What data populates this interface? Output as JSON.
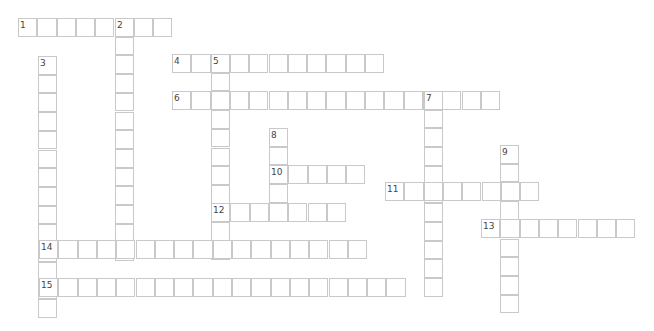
{
  "puzzle": {
    "type": "crossword",
    "cell_w": 19.3,
    "cell_h": 18.7,
    "words": [
      {
        "number": "1",
        "dir": "across",
        "x": 18,
        "y": 18,
        "length": 8
      },
      {
        "number": "2",
        "dir": "down",
        "x": 115,
        "y": 18,
        "length": 13
      },
      {
        "number": "3",
        "dir": "down",
        "x": 38,
        "y": 56,
        "length": 14
      },
      {
        "number": "4",
        "dir": "across",
        "x": 172,
        "y": 54,
        "length": 11
      },
      {
        "number": "5",
        "dir": "down",
        "x": 211,
        "y": 54,
        "length": 11
      },
      {
        "number": "6",
        "dir": "across",
        "x": 172,
        "y": 91,
        "length": 17
      },
      {
        "number": "7",
        "dir": "down",
        "x": 424,
        "y": 91,
        "length": 11
      },
      {
        "number": "8",
        "dir": "down",
        "x": 269,
        "y": 128,
        "length": 5
      },
      {
        "number": "9",
        "dir": "down",
        "x": 500,
        "y": 145,
        "length": 9
      },
      {
        "number": "10",
        "dir": "across",
        "x": 269,
        "y": 165,
        "length": 5
      },
      {
        "number": "11",
        "dir": "across",
        "x": 385,
        "y": 182,
        "length": 8
      },
      {
        "number": "12",
        "dir": "across",
        "x": 211,
        "y": 203,
        "length": 7
      },
      {
        "number": "13",
        "dir": "across",
        "x": 481,
        "y": 219,
        "length": 8
      },
      {
        "number": "14",
        "dir": "across",
        "x": 39,
        "y": 240,
        "length": 17
      },
      {
        "number": "15",
        "dir": "across",
        "x": 39,
        "y": 278,
        "length": 19
      }
    ]
  }
}
